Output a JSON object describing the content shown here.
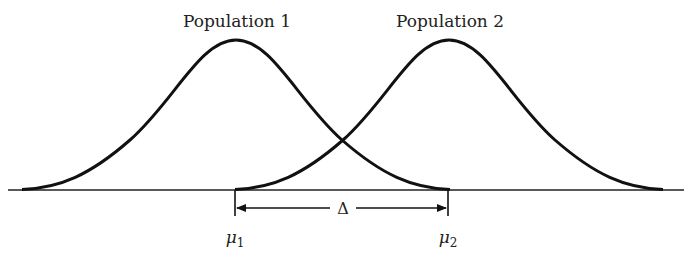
{
  "diagram": {
    "populations": [
      {
        "label": "Population 1",
        "mean_label": "μ",
        "mean_sub": "1"
      },
      {
        "label": "Population 2",
        "mean_label": "μ",
        "mean_sub": "2"
      }
    ],
    "difference_label": "Δ",
    "colors": {
      "stroke": "#111111",
      "text": "#222222",
      "background": "#ffffff"
    }
  }
}
